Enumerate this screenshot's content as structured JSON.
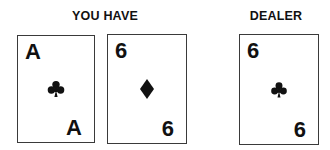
{
  "player": {
    "label": "YOU HAVE",
    "cards": [
      {
        "rank": "A",
        "suit": "clubs",
        "suit_icon": "club-icon"
      },
      {
        "rank": "6",
        "suit": "diamonds",
        "suit_icon": "diamond-icon"
      }
    ]
  },
  "dealer": {
    "label": "DEALER",
    "cards": [
      {
        "rank": "6",
        "suit": "clubs",
        "suit_icon": "club-icon"
      }
    ]
  },
  "colors": {
    "card_border": "#3a3a3a",
    "ink": "#111111",
    "background": "#ffffff"
  }
}
